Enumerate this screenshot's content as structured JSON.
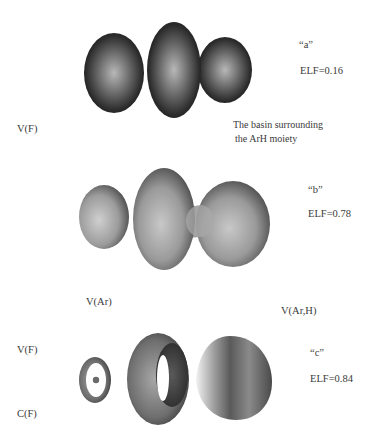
{
  "figure": {
    "panels": [
      {
        "id": "a",
        "label": "“a”",
        "elf": "ELF=0.16",
        "annotations": {
          "left": "V(F)",
          "right_line1": "The basin surrounding",
          "right_line2": "the ArH moiety"
        }
      },
      {
        "id": "b",
        "label": "“b”",
        "elf": "ELF=0.78",
        "annotations": {
          "bottom_left": "V(Ar)",
          "bottom_right": "V(Ar,H)"
        }
      },
      {
        "id": "c",
        "label": "“c”",
        "elf": "ELF=0.84",
        "annotations": {
          "left_top": "V(F)",
          "left_bottom": "C(F)"
        }
      }
    ],
    "colors": {
      "background": "#ffffff",
      "surface_dark": "#2e2e2e",
      "surface_mid": "#8a8a8a",
      "surface_light": "#d9d9d9",
      "text": "#3a3a3a"
    }
  }
}
